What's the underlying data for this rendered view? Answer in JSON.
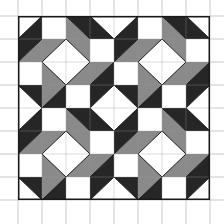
{
  "canvas": {
    "width": 224,
    "height": 224,
    "background": "#ffffff"
  },
  "grid": {
    "color": "#c8c8c8",
    "columns_x": [
      18,
      42,
      66,
      90,
      114,
      138,
      162,
      186,
      210
    ],
    "rows_y": [
      16,
      39,
      62,
      85,
      108,
      131,
      154,
      177,
      200
    ]
  },
  "quilt": {
    "x": 18,
    "y": 16,
    "cell_w": 24,
    "cell_h": 23,
    "cols": 8,
    "rows": 8,
    "outline_color": "#1a1a1a",
    "colors": {
      "W": "#ffffff",
      "D": "#262626",
      "G": "#8a8a8a"
    },
    "block_size": 4,
    "block": [
      [
        [
          "a",
          "W",
          "D"
        ],
        [
          "s",
          "W"
        ],
        [
          "b",
          "D",
          "G"
        ],
        [
          "b",
          "W",
          "D"
        ]
      ],
      [
        [
          "a",
          "D",
          "G"
        ],
        [
          "a",
          "G",
          "W"
        ],
        [
          "b",
          "G",
          "W"
        ],
        [
          "s",
          "W"
        ]
      ],
      [
        [
          "s",
          "W"
        ],
        [
          "b",
          "W",
          "G"
        ],
        [
          "a",
          "W",
          "G"
        ],
        [
          "a",
          "G",
          "D"
        ]
      ],
      [
        [
          "b",
          "D",
          "W"
        ],
        [
          "a",
          "G",
          "D"
        ],
        [
          "s",
          "W"
        ],
        [
          "a",
          "D",
          "W"
        ]
      ]
    ]
  }
}
